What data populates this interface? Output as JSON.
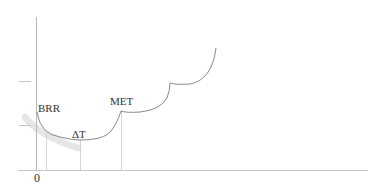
{
  "diagram": {
    "labels": {
      "origin": "0",
      "brr": "BRR",
      "delta_t": "ΔT",
      "met": "MET"
    },
    "colors": {
      "axis": "#b8b8b8",
      "curve": "#8a8a8a",
      "dropline": "#d0d0d0",
      "shadow": "#e6e6e6",
      "text": "#333333"
    }
  }
}
